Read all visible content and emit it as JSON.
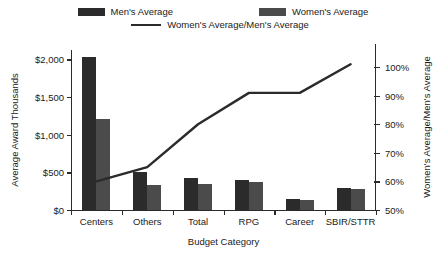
{
  "legend": {
    "items": [
      {
        "key": "men",
        "label": "Men's Average",
        "type": "bar",
        "color": "#2b2b2b"
      },
      {
        "key": "women",
        "label": "Women's Average",
        "type": "bar",
        "color": "#4b4b4b"
      },
      {
        "key": "ratio",
        "label": "Women's Average/Men's Average",
        "type": "line",
        "color": "#2b2b2b"
      }
    ]
  },
  "axes": {
    "x_title": "Budget Category",
    "y_left_title": "Average Award Thousands",
    "y_right_title": "Women's Average/Men's Average",
    "y_left_ticks": [
      "$0",
      "$500",
      "$1,000",
      "$1,500",
      "$2,000"
    ],
    "y_right_ticks": [
      "50%",
      "60%",
      "70%",
      "80%",
      "90%",
      "100%"
    ]
  },
  "chart_data": {
    "type": "bar",
    "title": "",
    "xlabel": "Budget Category",
    "ylabel": "Average Award Thousands",
    "y2label": "Women's Average/Men's Average",
    "categories": [
      "Centers",
      "Others",
      "Total",
      "RPG",
      "Career",
      "SBIR/STTR"
    ],
    "series": [
      {
        "name": "Men's Average",
        "type": "bar",
        "axis": "left",
        "color": "#2b2b2b",
        "values": [
          2030,
          505,
          430,
          395,
          140,
          290
        ]
      },
      {
        "name": "Women's Average",
        "type": "bar",
        "axis": "left",
        "color": "#4b4b4b",
        "values": [
          1215,
          330,
          345,
          370,
          130,
          275
        ]
      },
      {
        "name": "Women's Average/Men's Average",
        "type": "line",
        "axis": "right",
        "color": "#2b2b2b",
        "values": [
          60,
          65,
          80,
          91,
          91,
          101
        ]
      }
    ],
    "ylim": [
      0,
      2125
    ],
    "y2lim": [
      50,
      106
    ],
    "ytick_values": [
      0,
      500,
      1000,
      1500,
      2000
    ],
    "y2tick_values": [
      50,
      60,
      70,
      80,
      90,
      100
    ],
    "grid": false,
    "legend_position": "top"
  }
}
